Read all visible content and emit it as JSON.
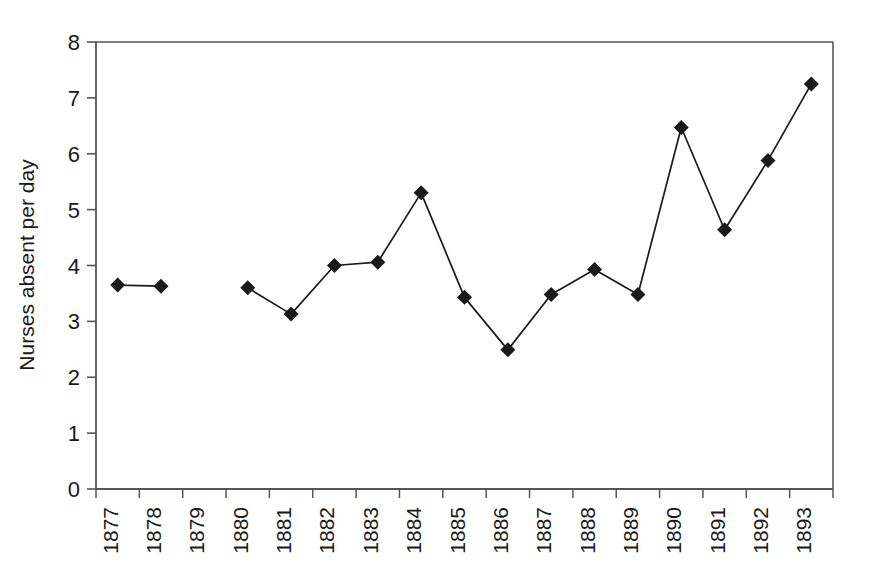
{
  "chart_data": {
    "type": "line",
    "title": "",
    "subtitle": "",
    "xlabel": "",
    "ylabel": "Nurses absent per day",
    "categories": [
      "1877",
      "1878",
      "1879",
      "1880",
      "1881",
      "1882",
      "1883",
      "1884",
      "1885",
      "1886",
      "1887",
      "1888",
      "1889",
      "1890",
      "1891",
      "1892",
      "1893"
    ],
    "values": [
      3.65,
      3.63,
      null,
      3.6,
      3.13,
      4.0,
      4.06,
      5.3,
      3.43,
      2.49,
      3.48,
      3.93,
      3.48,
      6.47,
      4.64,
      5.88,
      7.25
    ],
    "series": [
      {
        "name": "Nurses absent per day",
        "values": [
          3.65,
          3.63,
          null,
          3.6,
          3.13,
          4.0,
          4.06,
          5.3,
          3.43,
          2.49,
          3.48,
          3.93,
          3.48,
          6.47,
          4.64,
          5.88,
          7.25
        ]
      }
    ],
    "missing_categories": [
      "1879"
    ],
    "ylim": [
      0,
      8
    ],
    "ytick_values": [
      "0",
      "1",
      "2",
      "3",
      "4",
      "5",
      "6",
      "7",
      "8"
    ],
    "grid": false,
    "legend": false,
    "legend_position": "none",
    "marker": "diamond",
    "marker_color": "#1a1a1a",
    "line_color": "#1a1a1a",
    "axis_color": "#555555",
    "background_color": "#ffffff",
    "xtick_rotation": -90
  },
  "plot": {
    "left": 96,
    "right": 833,
    "top": 42,
    "bottom": 489
  }
}
